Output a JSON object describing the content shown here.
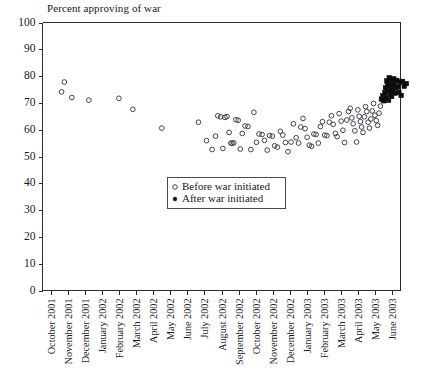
{
  "chart_data": {
    "type": "scatter",
    "title": "Percent approving of war",
    "xlabel": "",
    "ylabel": "",
    "ylim": [
      0,
      100
    ],
    "ytick_step": 10,
    "yticks": [
      0,
      10,
      20,
      30,
      40,
      50,
      60,
      70,
      80,
      90,
      100
    ],
    "grid": false,
    "legend_position": "center-left-lower",
    "categories": [
      "October 2001",
      "November 2001",
      "December 2001",
      "January 2002",
      "February 2002",
      "March 2002",
      "April 2002",
      "May 2002",
      "June 2002",
      "July 2002",
      "August 2002",
      "September 2002",
      "October 2002",
      "November 2002",
      "December 2002",
      "January 2003",
      "February 2003",
      "March 2003",
      "April 2003",
      "May 2003",
      "June 2003"
    ],
    "series": [
      {
        "name": "Before war initiated",
        "marker": "open-circle",
        "color": "#3a3a46",
        "points": [
          {
            "x": 1.28,
            "y": 77.8
          },
          {
            "x": 1.12,
            "y": 74.1
          },
          {
            "x": 1.72,
            "y": 72.0
          },
          {
            "x": 2.72,
            "y": 71.0
          },
          {
            "x": 4.48,
            "y": 71.7
          },
          {
            "x": 5.3,
            "y": 67.6
          },
          {
            "x": 7.0,
            "y": 60.6
          },
          {
            "x": 9.15,
            "y": 62.8
          },
          {
            "x": 9.62,
            "y": 55.9
          },
          {
            "x": 9.95,
            "y": 52.6
          },
          {
            "x": 10.15,
            "y": 57.6
          },
          {
            "x": 10.28,
            "y": 65.2
          },
          {
            "x": 10.45,
            "y": 64.8
          },
          {
            "x": 10.58,
            "y": 53.0
          },
          {
            "x": 10.7,
            "y": 64.6
          },
          {
            "x": 10.82,
            "y": 64.9
          },
          {
            "x": 10.95,
            "y": 59.0
          },
          {
            "x": 11.05,
            "y": 55.0
          },
          {
            "x": 11.12,
            "y": 54.9
          },
          {
            "x": 11.22,
            "y": 55.1
          },
          {
            "x": 11.35,
            "y": 63.7
          },
          {
            "x": 11.48,
            "y": 63.5
          },
          {
            "x": 11.6,
            "y": 52.8
          },
          {
            "x": 11.72,
            "y": 58.6
          },
          {
            "x": 11.88,
            "y": 61.4
          },
          {
            "x": 12.05,
            "y": 61.2
          },
          {
            "x": 12.22,
            "y": 52.6
          },
          {
            "x": 12.4,
            "y": 66.5
          },
          {
            "x": 12.55,
            "y": 55.3
          },
          {
            "x": 12.7,
            "y": 58.4
          },
          {
            "x": 12.88,
            "y": 58.2
          },
          {
            "x": 13.02,
            "y": 56.0
          },
          {
            "x": 13.18,
            "y": 52.4
          },
          {
            "x": 13.32,
            "y": 57.8
          },
          {
            "x": 13.48,
            "y": 57.6
          },
          {
            "x": 13.62,
            "y": 54.0
          },
          {
            "x": 13.78,
            "y": 53.5
          },
          {
            "x": 13.95,
            "y": 59.4
          },
          {
            "x": 14.1,
            "y": 58.0
          },
          {
            "x": 14.25,
            "y": 55.2
          },
          {
            "x": 14.4,
            "y": 51.8
          },
          {
            "x": 14.58,
            "y": 55.4
          },
          {
            "x": 14.72,
            "y": 62.2
          },
          {
            "x": 14.88,
            "y": 57.0
          },
          {
            "x": 15.02,
            "y": 55.0
          },
          {
            "x": 15.15,
            "y": 61.0
          },
          {
            "x": 15.28,
            "y": 64.2
          },
          {
            "x": 15.4,
            "y": 60.4
          },
          {
            "x": 15.52,
            "y": 57.2
          },
          {
            "x": 15.65,
            "y": 54.2
          },
          {
            "x": 15.78,
            "y": 53.8
          },
          {
            "x": 15.92,
            "y": 58.4
          },
          {
            "x": 16.05,
            "y": 58.2
          },
          {
            "x": 16.18,
            "y": 55.0
          },
          {
            "x": 16.3,
            "y": 61.2
          },
          {
            "x": 16.42,
            "y": 63.0
          },
          {
            "x": 16.55,
            "y": 58.0
          },
          {
            "x": 16.68,
            "y": 57.8
          },
          {
            "x": 16.82,
            "y": 62.8
          },
          {
            "x": 16.95,
            "y": 65.2
          },
          {
            "x": 17.05,
            "y": 62.0
          },
          {
            "x": 17.18,
            "y": 58.6
          },
          {
            "x": 17.28,
            "y": 57.4
          },
          {
            "x": 17.4,
            "y": 66.0
          },
          {
            "x": 17.52,
            "y": 63.2
          },
          {
            "x": 17.62,
            "y": 59.8
          },
          {
            "x": 17.72,
            "y": 55.2
          },
          {
            "x": 17.85,
            "y": 63.6
          },
          {
            "x": 17.95,
            "y": 66.8
          },
          {
            "x": 18.05,
            "y": 68.0
          },
          {
            "x": 18.15,
            "y": 64.4
          },
          {
            "x": 18.22,
            "y": 62.2
          },
          {
            "x": 18.32,
            "y": 59.6
          },
          {
            "x": 18.42,
            "y": 55.4
          },
          {
            "x": 18.5,
            "y": 67.4
          },
          {
            "x": 18.58,
            "y": 65.0
          },
          {
            "x": 18.65,
            "y": 63.0
          },
          {
            "x": 18.72,
            "y": 61.0
          },
          {
            "x": 18.8,
            "y": 59.0
          },
          {
            "x": 18.88,
            "y": 64.8
          },
          {
            "x": 18.95,
            "y": 68.6
          },
          {
            "x": 19.02,
            "y": 66.8
          },
          {
            "x": 19.1,
            "y": 62.8
          },
          {
            "x": 19.18,
            "y": 60.6
          },
          {
            "x": 19.26,
            "y": 64.0
          },
          {
            "x": 19.34,
            "y": 67.0
          },
          {
            "x": 19.42,
            "y": 69.8
          },
          {
            "x": 19.5,
            "y": 65.4
          },
          {
            "x": 19.58,
            "y": 63.4
          },
          {
            "x": 19.66,
            "y": 61.6
          },
          {
            "x": 19.74,
            "y": 66.2
          },
          {
            "x": 19.82,
            "y": 68.8
          }
        ]
      },
      {
        "name": "After war initiated",
        "marker": "filled-square",
        "color": "#0d0d0d",
        "points": [
          {
            "x": 19.88,
            "y": 71.4
          },
          {
            "x": 19.96,
            "y": 72.6
          },
          {
            "x": 20.02,
            "y": 70.8
          },
          {
            "x": 20.08,
            "y": 73.8
          },
          {
            "x": 20.12,
            "y": 75.6
          },
          {
            "x": 20.16,
            "y": 72.0
          },
          {
            "x": 20.2,
            "y": 78.2
          },
          {
            "x": 20.24,
            "y": 76.4
          },
          {
            "x": 20.28,
            "y": 74.2
          },
          {
            "x": 20.3,
            "y": 71.0
          },
          {
            "x": 20.34,
            "y": 79.4
          },
          {
            "x": 20.36,
            "y": 77.0
          },
          {
            "x": 20.4,
            "y": 73.2
          },
          {
            "x": 20.42,
            "y": 75.0
          },
          {
            "x": 20.46,
            "y": 78.8
          },
          {
            "x": 20.48,
            "y": 72.4
          },
          {
            "x": 20.52,
            "y": 76.6
          },
          {
            "x": 20.56,
            "y": 74.6
          },
          {
            "x": 20.6,
            "y": 79.0
          },
          {
            "x": 20.64,
            "y": 77.4
          },
          {
            "x": 20.68,
            "y": 73.6
          },
          {
            "x": 20.72,
            "y": 75.8
          },
          {
            "x": 20.78,
            "y": 78.4
          },
          {
            "x": 20.84,
            "y": 76.0
          },
          {
            "x": 20.9,
            "y": 74.0
          },
          {
            "x": 20.96,
            "y": 77.8
          },
          {
            "x": 21.04,
            "y": 72.8
          },
          {
            "x": 21.12,
            "y": 78.0
          },
          {
            "x": 21.22,
            "y": 76.2
          },
          {
            "x": 21.34,
            "y": 77.2
          }
        ]
      }
    ]
  },
  "legend": {
    "entries": [
      {
        "label": "Before war initiated",
        "marker": "open-circle"
      },
      {
        "label": "After war initiated",
        "marker": "filled-dot"
      }
    ]
  }
}
